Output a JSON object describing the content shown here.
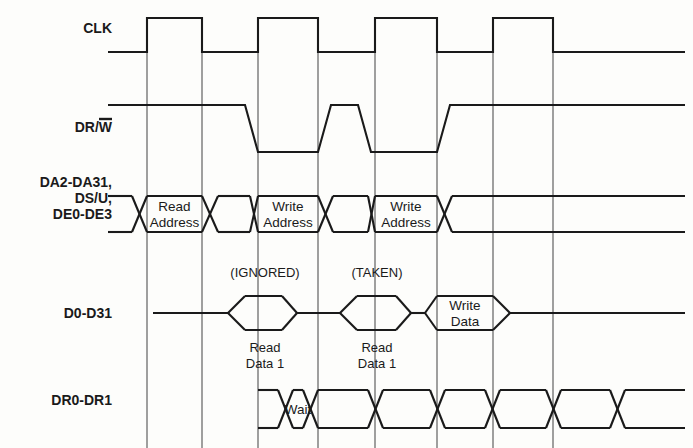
{
  "diagram": {
    "type": "timing-diagram",
    "width": 693,
    "height": 448,
    "colors": {
      "ink": "#1a1a1a",
      "grid": "#4a4a4a",
      "background": "#fdfdfb"
    },
    "signals": [
      {
        "id": "clk",
        "label": "CLK",
        "label_overbar": "",
        "label_lines": [
          "CLK"
        ],
        "label_x": 112,
        "label_y": 33,
        "kind": "clock",
        "low_y": 52,
        "high_y": 18,
        "start_x": 108,
        "end_x": 685,
        "pulses": [
          [
            147,
            202
          ],
          [
            258,
            318
          ],
          [
            375,
            437
          ],
          [
            493,
            553
          ]
        ]
      },
      {
        "id": "drw",
        "label": "DR/W",
        "label_overbar": "W",
        "label_lines": [
          "DR/W"
        ],
        "label_x": 112,
        "label_y": 132,
        "kind": "level",
        "high_y": 105,
        "low_y": 152,
        "start_x": 108,
        "end_x": 685,
        "slope": 13,
        "transitions": [
          {
            "x": 245,
            "to": "low"
          },
          {
            "x": 318,
            "to": "high"
          },
          {
            "x": 358,
            "to": "low"
          },
          {
            "x": 437,
            "to": "high"
          }
        ]
      },
      {
        "id": "da_bus",
        "label": "DA2-DA31, DS/U, DE0-DE3",
        "label_lines": [
          "DA2-DA31,",
          "DS/U,",
          "DE0-DE3"
        ],
        "label_x": 112,
        "label_y": 203,
        "label_line_height": 16,
        "kind": "bus",
        "top_y": 196,
        "bot_y": 232,
        "mid_y": 214,
        "start_x": 108,
        "end_x": 685,
        "cross": 15,
        "segments": [
          {
            "from": 108,
            "to": 132,
            "state": "valid",
            "text": ""
          },
          {
            "from": 147,
            "to": 202,
            "state": "valid",
            "text": "Read\nAddress",
            "lines": [
              "Read",
              "Address"
            ]
          },
          {
            "from": 218,
            "to": 250,
            "state": "valid",
            "text": ""
          },
          {
            "from": 258,
            "to": 318,
            "state": "valid",
            "text": "Write\nAddress",
            "lines": [
              "Write",
              "Address"
            ]
          },
          {
            "from": 333,
            "to": 368,
            "state": "valid",
            "text": ""
          },
          {
            "from": 375,
            "to": 437,
            "state": "valid",
            "text": "Write\nAddress",
            "lines": [
              "Write",
              "Address"
            ]
          },
          {
            "from": 452,
            "to": 685,
            "state": "valid",
            "text": ""
          }
        ]
      },
      {
        "id": "d_bus",
        "label": "D0-D31",
        "label_lines": [
          "D0-D31"
        ],
        "label_x": 112,
        "label_y": 318,
        "kind": "bus",
        "top_y": 296,
        "bot_y": 330,
        "mid_y": 313,
        "start_x": 153,
        "end_x": 685,
        "cross": 15,
        "segments": [
          {
            "from": 153,
            "to": 228,
            "state": "idle",
            "text": ""
          },
          {
            "from": 245,
            "to": 282,
            "state": "valid",
            "text": ""
          },
          {
            "from": 297,
            "to": 340,
            "state": "idle",
            "text": ""
          },
          {
            "from": 357,
            "to": 396,
            "state": "valid",
            "text": ""
          },
          {
            "from": 411,
            "to": 425,
            "state": "idle",
            "text": ""
          },
          {
            "from": 437,
            "to": 493,
            "state": "valid",
            "text": "Write\nData",
            "lines": [
              "Write",
              "Data"
            ]
          },
          {
            "from": 510,
            "to": 685,
            "state": "idle",
            "text": ""
          }
        ]
      },
      {
        "id": "dr_bus",
        "label": "DR0-DR1",
        "label_lines": [
          "DR0-DR1"
        ],
        "label_x": 112,
        "label_y": 405,
        "kind": "bus",
        "top_y": 390,
        "bot_y": 428,
        "mid_y": 409,
        "start_x": 258,
        "end_x": 685,
        "cross": 15,
        "segments": [
          {
            "from": 258,
            "to": 278,
            "state": "valid",
            "text": ""
          },
          {
            "from": 293,
            "to": 303,
            "state": "valid",
            "text": "Wait",
            "lines": [
              "Wait"
            ]
          },
          {
            "from": 318,
            "to": 368,
            "state": "valid",
            "text": ""
          },
          {
            "from": 383,
            "to": 430,
            "state": "valid",
            "text": ""
          },
          {
            "from": 445,
            "to": 485,
            "state": "valid",
            "text": ""
          },
          {
            "from": 500,
            "to": 546,
            "state": "valid",
            "text": ""
          },
          {
            "from": 561,
            "to": 610,
            "state": "valid",
            "text": ""
          },
          {
            "from": 625,
            "to": 685,
            "state": "valid",
            "text": ""
          }
        ]
      }
    ],
    "gridlines": [
      {
        "x": 147,
        "y1": 18,
        "y2": 448
      },
      {
        "x": 202,
        "y1": 18,
        "y2": 448
      },
      {
        "x": 258,
        "y1": 18,
        "y2": 448
      },
      {
        "x": 318,
        "y1": 18,
        "y2": 448
      },
      {
        "x": 375,
        "y1": 18,
        "y2": 448
      },
      {
        "x": 437,
        "y1": 18,
        "y2": 448
      },
      {
        "x": 493,
        "y1": 18,
        "y2": 448
      },
      {
        "x": 553,
        "y1": 18,
        "y2": 448
      }
    ],
    "annotations": [
      {
        "id": "ignored",
        "text": "(IGNORED)",
        "x": 265,
        "y": 277,
        "name": "ignored-note"
      },
      {
        "id": "taken",
        "text": "(TAKEN)",
        "x": 377,
        "y": 277,
        "name": "taken-note"
      },
      {
        "id": "read_data_1_a",
        "text": "Read\nData 1",
        "lines": [
          "Read",
          "Data 1"
        ],
        "x": 265,
        "y": 352,
        "name": "read-data-1-note"
      },
      {
        "id": "read_data_1_b",
        "text": "Read\nData 1",
        "lines": [
          "Read",
          "Data 1"
        ],
        "x": 377,
        "y": 352,
        "name": "read-data-1-note"
      }
    ]
  }
}
